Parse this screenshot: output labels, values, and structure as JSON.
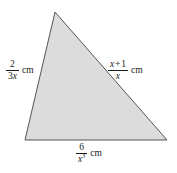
{
  "figure": {
    "name": "triangle-with-algebraic-side-lengths",
    "background_color": "#ffffff",
    "shape": {
      "type": "triangle",
      "fill_color": "#dcdcdc",
      "stroke_color": "#55555a",
      "vertices": [
        {
          "name": "apex",
          "x": 55,
          "y": 12
        },
        {
          "name": "bottom-right",
          "x": 167,
          "y": 140
        },
        {
          "name": "bottom-left",
          "x": 25,
          "y": 140
        }
      ]
    }
  },
  "labels": {
    "left": {
      "side": "left-side",
      "numerator": "2",
      "denominator_coefficient": "3",
      "denominator_variable": "x",
      "unit": "cm",
      "expression": "2/(3x) cm"
    },
    "right": {
      "side": "right-side",
      "numerator_variable": "x",
      "numerator_operator": "+",
      "numerator_constant": "1",
      "denominator_variable": "x",
      "unit": "cm",
      "expression": "(x + 1)/x cm"
    },
    "bottom": {
      "side": "base",
      "numerator": "6",
      "denominator_variable": "x",
      "denominator_exponent": "3",
      "unit": "cm",
      "expression": "6/x^3 cm"
    }
  }
}
